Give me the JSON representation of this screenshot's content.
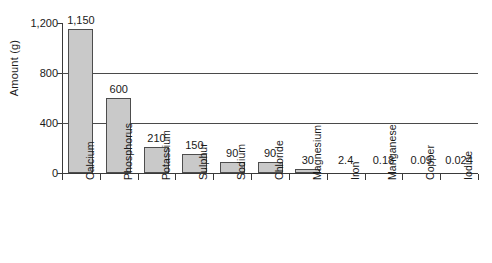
{
  "chart_data": {
    "type": "bar",
    "title": "",
    "subtitle": "",
    "xlabel": "",
    "ylabel": "Amount (g)",
    "ylim": [
      0,
      1200
    ],
    "yticks": [
      0,
      400,
      800,
      1200
    ],
    "ytick_labels": [
      "0",
      "400",
      "800",
      "1,200"
    ],
    "grid": true,
    "gridlines_at": [
      400,
      800
    ],
    "legend": null,
    "legend_position": "none",
    "categories": [
      "Calcium",
      "Phosphorus",
      "Potassium",
      "Sulphur",
      "Sodium",
      "Chloride",
      "Magnesium",
      "Iron",
      "Manganese",
      "Copper",
      "Iodine"
    ],
    "values": [
      1150,
      600,
      210,
      150,
      90,
      90,
      30,
      2.4,
      0.18,
      0.09,
      0.024
    ],
    "value_labels": [
      "1,150",
      "600",
      "210",
      "150",
      "90",
      "90",
      "30",
      "2.4",
      "0.18",
      "0.09",
      "0.024"
    ],
    "bar_fill_color": "#c9c9c9",
    "bar_edge_color": "#4d4d4d",
    "axis_color": "#3a3a3a",
    "text_color": "#1a1a1a",
    "background_color": "#ffffff"
  }
}
